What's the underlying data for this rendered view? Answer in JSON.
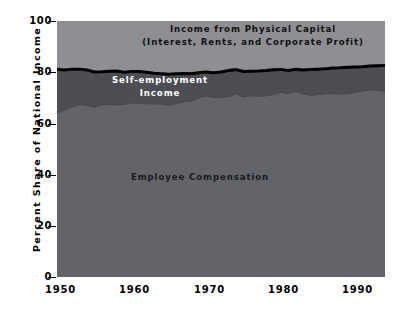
{
  "chart_data": {
    "type": "area",
    "title": "",
    "xlabel": "",
    "ylabel": "Percent Share of National Income",
    "xlim": [
      1950,
      1994
    ],
    "ylim": [
      0,
      100
    ],
    "grid": false,
    "legend_position": "in-plot annotations",
    "stacked": true,
    "xticks": [
      "1950",
      "1960",
      "1970",
      "1980",
      "1990"
    ],
    "xtick_values": [
      1950,
      1960,
      1970,
      1980,
      1990
    ],
    "yticks": [
      "0",
      "20",
      "40",
      "60",
      "80",
      "100"
    ],
    "ytick_values": [
      0,
      20,
      40,
      60,
      80,
      100
    ],
    "annotations": [
      {
        "name": "capital",
        "text": "Income from Physical Capital\n(Interest, Rents, and Corporate Profit)",
        "color": "#111111"
      },
      {
        "name": "self-employment",
        "text": "Self-employment\nIncome",
        "color": "#ffffff"
      },
      {
        "name": "employee",
        "text": "Employee Compensation",
        "color": "#1b1b1b"
      }
    ],
    "x": [
      1950,
      1951,
      1952,
      1953,
      1954,
      1955,
      1956,
      1957,
      1958,
      1959,
      1960,
      1961,
      1962,
      1963,
      1964,
      1965,
      1966,
      1967,
      1968,
      1969,
      1970,
      1971,
      1972,
      1973,
      1974,
      1975,
      1976,
      1977,
      1978,
      1979,
      1980,
      1981,
      1982,
      1983,
      1984,
      1985,
      1986,
      1987,
      1988,
      1989,
      1990,
      1991,
      1992,
      1993,
      1994
    ],
    "series": [
      {
        "name": "Employee Compensation",
        "color": "#63636a",
        "values": [
          64.2,
          65.3,
          66.4,
          67.4,
          67.0,
          66.4,
          67.3,
          67.6,
          67.2,
          67.4,
          68.1,
          67.9,
          67.7,
          67.6,
          67.6,
          67.1,
          67.8,
          68.5,
          68.8,
          70.0,
          70.8,
          70.2,
          70.1,
          70.4,
          71.6,
          70.4,
          70.8,
          70.6,
          70.7,
          71.3,
          72.2,
          71.6,
          72.6,
          71.5,
          70.9,
          71.2,
          71.6,
          71.7,
          71.4,
          71.6,
          72.1,
          72.6,
          73.2,
          73.0,
          72.6
        ]
      },
      {
        "name": "Self-employment Income",
        "color": "#4d4d54",
        "values": [
          17.0,
          15.6,
          14.8,
          13.8,
          13.9,
          13.7,
          12.9,
          12.8,
          13.3,
          12.6,
          12.2,
          12.4,
          12.3,
          12.0,
          11.8,
          12.1,
          11.6,
          11.0,
          10.6,
          9.8,
          9.3,
          9.6,
          10.0,
          10.3,
          9.4,
          9.9,
          9.6,
          9.9,
          10.0,
          9.7,
          8.9,
          9.1,
          8.5,
          9.4,
          10.2,
          10.0,
          9.7,
          9.9,
          10.3,
          10.3,
          9.9,
          9.5,
          9.2,
          9.5,
          10.0
        ]
      },
      {
        "name": "Income from Physical Capital (Interest, Rents, and Corporate Profit)",
        "color": "#8e8e93",
        "values": [
          18.8,
          19.1,
          18.8,
          18.8,
          19.1,
          19.9,
          19.8,
          19.6,
          19.5,
          20.0,
          19.7,
          19.7,
          20.0,
          20.4,
          20.6,
          20.8,
          20.6,
          20.5,
          20.6,
          20.2,
          19.9,
          20.2,
          19.9,
          19.3,
          19.0,
          19.7,
          19.6,
          19.5,
          19.3,
          19.0,
          18.9,
          19.3,
          18.9,
          19.1,
          18.9,
          18.8,
          18.7,
          18.4,
          18.3,
          18.1,
          18.0,
          17.9,
          17.6,
          17.5,
          17.4
        ]
      }
    ]
  },
  "colors": {
    "background": "#ffffff",
    "employee_band": "#63636a",
    "self_employment_band": "#4d4d54",
    "capital_band": "#8e8e93",
    "top_boundary_line": "#000000",
    "lower_boundary_line": "#4a4a50",
    "axis": "#000000"
  }
}
